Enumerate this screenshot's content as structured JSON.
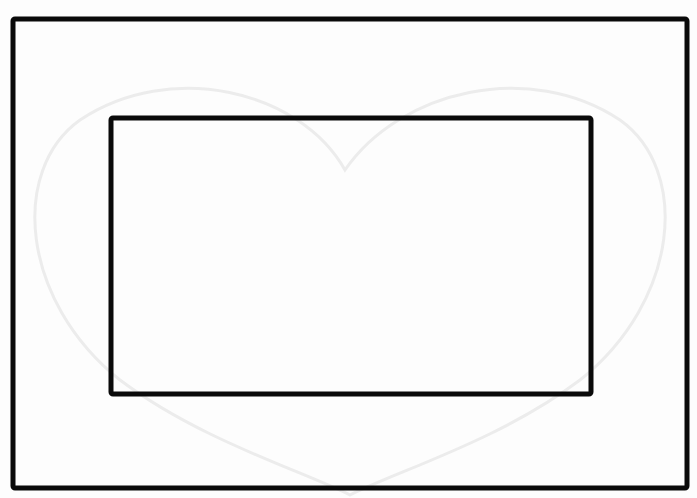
{
  "figure": {
    "title": "",
    "background": "#fdfdfd",
    "stroke_color": "#0a0a0a",
    "watermark_color": "#eeeeee",
    "shapes": [
      {
        "name": "outer-rectangle",
        "x": 13,
        "y": 19,
        "width": 674,
        "height": 469,
        "stroke_width": 5
      },
      {
        "name": "inner-rectangle",
        "x": 111,
        "y": 118,
        "width": 480,
        "height": 276,
        "stroke_width": 5
      }
    ],
    "watermark": "heart"
  }
}
